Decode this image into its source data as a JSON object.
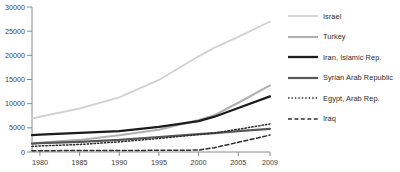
{
  "chart_data": {
    "type": "line",
    "title": "",
    "xlabel": "",
    "ylabel": "",
    "xlim": [
      1979,
      2009
    ],
    "ylim": [
      0,
      30000
    ],
    "grid": false,
    "legend_position": "right",
    "xticks": [
      1980,
      1985,
      1990,
      1995,
      2000,
      2005,
      2009
    ],
    "xticklabels": [
      "1980",
      "1985",
      "1990",
      "1995",
      "2000",
      "2005",
      "2009"
    ],
    "yticks": [
      0,
      5000,
      10000,
      15000,
      20000,
      25000,
      30000
    ],
    "yticklabels": [
      "0",
      "5000",
      "10000",
      "15000",
      "20000",
      "25000",
      "30000"
    ],
    "x": [
      1979,
      1980,
      1985,
      1990,
      1995,
      2000,
      2002,
      2005,
      2009
    ],
    "series": [
      {
        "name": "Israel",
        "color": "#d2d2d2",
        "style": "solid",
        "width": 1.9,
        "values": [
          6900,
          7300,
          9000,
          11300,
          14900,
          19800,
          21600,
          23800,
          27000
        ]
      },
      {
        "name": "Turkey",
        "color": "#b0b0b0",
        "style": "solid",
        "width": 2.1,
        "values": [
          1700,
          1900,
          2500,
          3450,
          4600,
          6600,
          7600,
          10200,
          13800
        ]
      },
      {
        "name": "Iran, Islamic Rep.",
        "color": "#1c1c1c",
        "style": "solid",
        "width": 2.3,
        "values": [
          3500,
          3600,
          3950,
          4300,
          5200,
          6400,
          7300,
          9100,
          11500
        ]
      },
      {
        "name": "Syrian Arab Republic",
        "color": "#575757",
        "style": "solid",
        "width": 2.2,
        "values": [
          1750,
          1850,
          2100,
          2500,
          3100,
          3700,
          3900,
          4300,
          4800
        ]
      },
      {
        "name": "Egypt, Arab Rep.",
        "color": "#2e2e2e",
        "style": "dotted",
        "width": 1.5,
        "values": [
          1150,
          1250,
          1550,
          2100,
          2800,
          3600,
          3950,
          4700,
          5800
        ]
      },
      {
        "name": "Iraq",
        "color": "#2e2e2e",
        "style": "dashed",
        "width": 1.5,
        "values": [
          260,
          270,
          300,
          330,
          340,
          400,
          900,
          2000,
          3500
        ]
      }
    ]
  },
  "legend": {
    "items": [
      {
        "label": "Israel"
      },
      {
        "label": "Turkey"
      },
      {
        "label": "Iran, Islamic Rep."
      },
      {
        "label": "Syrian Arab Republic"
      },
      {
        "label": "Egypt, Arab Rep."
      },
      {
        "label": "Iraq"
      }
    ]
  },
  "caption": {
    "text": ""
  },
  "colors": {
    "axis": "#8a8a8a",
    "tick_text": "#3b3b3b",
    "background": "#ffffff"
  }
}
